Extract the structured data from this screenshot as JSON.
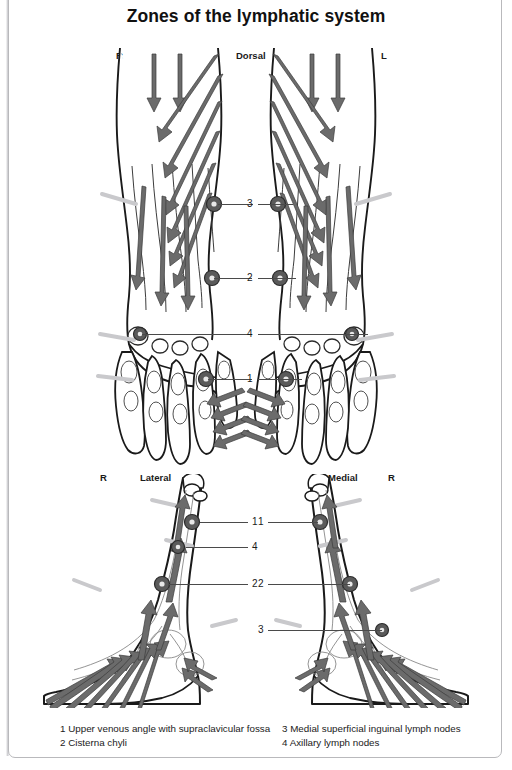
{
  "page": {
    "title": "Zones of the lymphatic system",
    "background_color": "#ffffff",
    "frame_color": "#b9b9bc",
    "ink_color": "#1a1a1a",
    "arrow_fill": "#6b6b6b",
    "arrow_stroke": "#3c3c3c",
    "node_color": "#5a5a5a",
    "leader_color": "#4a4a4a"
  },
  "figures": {
    "upper": {
      "name": "dorsal-view",
      "view_label": "Dorsal",
      "side_left": "R",
      "side_right": "L",
      "callouts": [
        {
          "number": "3",
          "y": 204
        },
        {
          "number": "2",
          "y": 278
        },
        {
          "number": "4",
          "y": 334
        },
        {
          "number": "1",
          "y": 379
        }
      ]
    },
    "lower_left": {
      "name": "lateral-view",
      "view_label": "Lateral",
      "side_label": "R",
      "callouts": [
        {
          "number": "1",
          "y": 522
        },
        {
          "number": "4",
          "y": 547
        },
        {
          "number": "2",
          "y": 584
        }
      ]
    },
    "lower_right": {
      "name": "medial-view",
      "view_label": "Medial",
      "side_label": "R",
      "callouts": [
        {
          "number": "1",
          "y": 522
        },
        {
          "number": "2",
          "y": 584
        },
        {
          "number": "3",
          "y": 630
        }
      ]
    }
  },
  "legend": {
    "left_column": [
      "1 Upper venous angle with supraclavicular fossa",
      "2 Cisterna chyli"
    ],
    "right_column": [
      "3 Medial superficial inguinal lymph nodes",
      "4 Axillary lymph nodes"
    ]
  }
}
